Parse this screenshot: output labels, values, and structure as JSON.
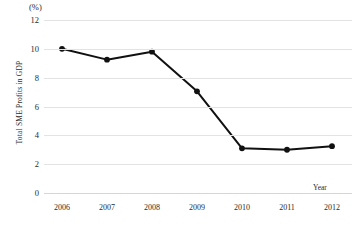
{
  "chart_data": {
    "type": "line",
    "title": "",
    "subtitle": "",
    "unit_label": "(%)",
    "xlabel": "Year",
    "ylabel": "Total SME Profits in GDP",
    "categories": [
      "2006",
      "2007",
      "2008",
      "2009",
      "2010",
      "2011",
      "2012"
    ],
    "x": [
      2006,
      2007,
      2008,
      2009,
      2010,
      2011,
      2012
    ],
    "values": [
      10.0,
      9.25,
      9.8,
      7.05,
      3.1,
      3.0,
      3.25
    ],
    "series": [
      {
        "name": "Total SME Profits in GDP",
        "values": [
          10.0,
          9.25,
          9.8,
          7.05,
          3.1,
          3.0,
          3.25
        ]
      }
    ],
    "ylim": [
      0,
      12
    ],
    "yticks": [
      0,
      2,
      4,
      6,
      8,
      10,
      12
    ],
    "ytick_labels": [
      "0",
      "2",
      "4",
      "6",
      "8",
      "10",
      "12"
    ],
    "xlim": [
      2005.5,
      2012.5
    ],
    "grid": "horizontal",
    "legend": "none",
    "marker": "filled-circle",
    "line_color": "#111111",
    "marker_color": "#111111",
    "grid_color": "#e3e3e3",
    "background_color": "#ffffff"
  },
  "axis": {
    "unit_label": "(%)",
    "y_title": "Total SME Profits in GDP",
    "x_title": "Year"
  }
}
